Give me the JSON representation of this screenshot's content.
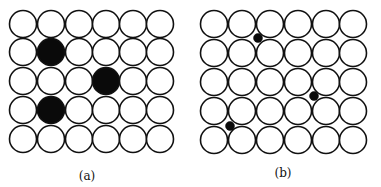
{
  "figure": {
    "panels": [
      {
        "id": "a",
        "label": "(a)",
        "description": "Substitutional defects in a square lattice",
        "rows": 5,
        "cols": 6,
        "col_centers": [
          23,
          51,
          79,
          106,
          133,
          160
        ],
        "row_centers": [
          24,
          52,
          81,
          110,
          139
        ],
        "radius": 13.5,
        "filled_sites": [
          [
            1,
            1
          ],
          [
            2,
            3
          ],
          [
            3,
            1
          ]
        ],
        "label_pos": [
          87,
          180
        ]
      },
      {
        "id": "b",
        "label": "(b)",
        "description": "Interstitial defects in a square lattice",
        "rows": 5,
        "cols": 6,
        "col_centers": [
          214,
          242,
          270,
          298,
          326,
          353
        ],
        "row_centers": [
          24,
          53,
          82,
          111,
          140
        ],
        "radius": 13.5,
        "interstitials": [
          [
            258,
            38
          ],
          [
            314,
            96
          ],
          [
            230,
            126
          ]
        ],
        "interstitial_radius": 4.5,
        "label_pos": [
          283,
          177
        ]
      }
    ],
    "colors": {
      "atom_fill": "#ffffff",
      "atom_stroke": "#111111",
      "defect_fill": "#0a0a0a",
      "background": "#ffffff"
    }
  }
}
